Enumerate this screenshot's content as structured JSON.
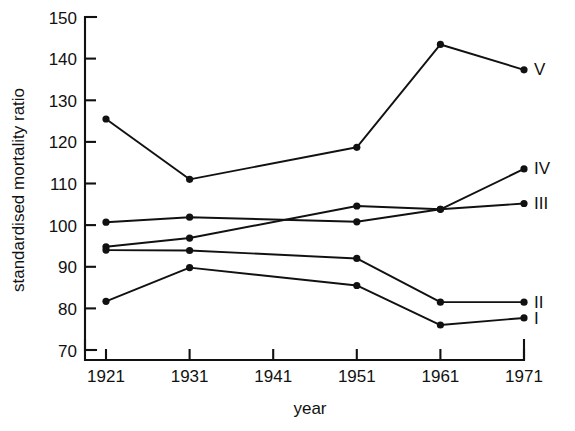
{
  "chart_data": {
    "type": "line",
    "title": "",
    "xlabel": "year",
    "ylabel": "standardised mortality ratio",
    "x": [
      1921,
      1931,
      1941,
      1951,
      1961,
      1971
    ],
    "xticklabels": [
      "1921",
      "1931",
      "1941",
      "1951",
      "1961",
      "1971"
    ],
    "yticklabels": [
      "70",
      "80",
      "90",
      "100",
      "110",
      "120",
      "130",
      "140",
      "150"
    ],
    "xlim": [
      1921,
      1971
    ],
    "ylim": [
      70,
      150
    ],
    "grid": false,
    "legend_position": "right-of-last-point",
    "series": [
      {
        "name": "V",
        "label": "V",
        "x": [
          1921,
          1931,
          1951,
          1961,
          1971
        ],
        "values": [
          125.5,
          111.0,
          118.7,
          143.4,
          137.3
        ]
      },
      {
        "name": "IV",
        "label": "IV",
        "x": [
          1921,
          1931,
          1951,
          1961,
          1971
        ],
        "values": [
          100.7,
          101.9,
          100.8,
          103.8,
          113.5
        ]
      },
      {
        "name": "III",
        "label": "III",
        "x": [
          1921,
          1931,
          1951,
          1961,
          1971
        ],
        "values": [
          94.8,
          96.9,
          104.6,
          103.8,
          105.2
        ]
      },
      {
        "name": "II",
        "label": "II",
        "x": [
          1921,
          1931,
          1951,
          1961,
          1971
        ],
        "values": [
          94.0,
          93.9,
          92.0,
          81.5,
          81.5
        ]
      },
      {
        "name": "I",
        "label": "I",
        "x": [
          1921,
          1931,
          1951,
          1961,
          1971
        ],
        "values": [
          81.7,
          89.8,
          85.5,
          76.0,
          77.7
        ]
      }
    ]
  },
  "axes": {
    "y_title": "standardised mortality ratio",
    "x_title": "year",
    "y_ticks": [
      "150",
      "140",
      "130",
      "120",
      "110",
      "100",
      "90",
      "80",
      "70"
    ],
    "x_ticks": [
      "1921",
      "1931",
      "1941",
      "1951",
      "1961",
      "1971"
    ]
  },
  "series_labels": {
    "v": "V",
    "iv": "IV",
    "iii": "III",
    "ii": "II",
    "i": "I"
  },
  "colors": {
    "ink": "#111111",
    "background": "#ffffff"
  }
}
